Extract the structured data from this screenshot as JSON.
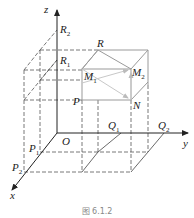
{
  "figure": {
    "caption": "图 6.1.2",
    "axes": {
      "x": "x",
      "y": "y",
      "z": "z",
      "origin": "O"
    },
    "points": {
      "R": "R",
      "R1": "R",
      "R2": "R",
      "M1": "M",
      "M2": "M",
      "N": "N",
      "P": "P",
      "P1": "P",
      "P2": "P",
      "Q1": "Q",
      "Q2": "Q"
    },
    "subscripts": {
      "one": "1",
      "two": "2"
    },
    "colors": {
      "axis": "#333333",
      "dashed": "#555555",
      "solid_box": "#9a9a9a",
      "arrow": "#c8c8c8"
    }
  }
}
